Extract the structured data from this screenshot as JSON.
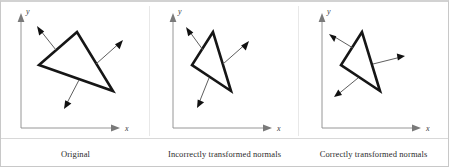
{
  "figure": {
    "background_color": "#ffffff",
    "frame_color": "#c8c8c8",
    "triangle_stroke_color": "#161616",
    "normal_arrow_color": "#111111",
    "axis_color": "#8a8a8a"
  },
  "panels": [
    {
      "id": "original",
      "caption": "Original",
      "y_axis_label": "y",
      "x_axis_label": "x",
      "triangle": [
        [
          76,
          30
        ],
        [
          38,
          63
        ],
        [
          112,
          89
        ]
      ],
      "normals": [
        {
          "name": "normal-upper-left",
          "from": [
            55,
            48
          ],
          "to": [
            36,
            24
          ]
        },
        {
          "name": "normal-upper-right",
          "from": [
            95,
            62
          ],
          "to": [
            122,
            38
          ]
        },
        {
          "name": "normal-lower",
          "from": [
            78,
            78
          ],
          "to": [
            63,
            107
          ]
        }
      ]
    },
    {
      "id": "incorrect",
      "caption": "Incorrectly transformed normals",
      "y_axis_label": "y",
      "x_axis_label": "x",
      "triangle": [
        [
          212,
          30
        ],
        [
          191,
          63
        ],
        [
          230,
          89
        ]
      ],
      "normals": [
        {
          "name": "normal-upper-left",
          "from": [
            202,
            48
          ],
          "to": [
            185,
            25
          ]
        },
        {
          "name": "normal-upper-right",
          "from": [
            222,
            62
          ],
          "to": [
            248,
            39
          ]
        },
        {
          "name": "normal-lower",
          "from": [
            208,
            76
          ],
          "to": [
            196,
            106
          ]
        }
      ]
    },
    {
      "id": "correct",
      "caption": "Correctly transformed normals",
      "y_axis_label": "y",
      "x_axis_label": "x",
      "triangle": [
        [
          361,
          30
        ],
        [
          340,
          63
        ],
        [
          379,
          89
        ]
      ],
      "normals": [
        {
          "name": "normal-upper-left",
          "from": [
            352,
            46
          ],
          "to": [
            328,
            32
          ]
        },
        {
          "name": "normal-upper-right",
          "from": [
            372,
            62
          ],
          "to": [
            404,
            54
          ]
        },
        {
          "name": "normal-lower",
          "from": [
            357,
            76
          ],
          "to": [
            333,
            95
          ]
        }
      ]
    }
  ]
}
